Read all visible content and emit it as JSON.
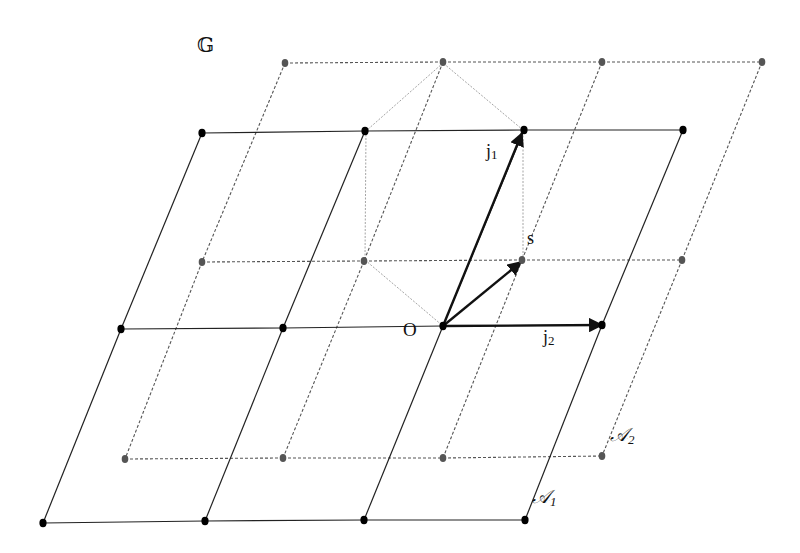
{
  "diagram": {
    "type": "two overlapping 2D lattices with hexagonal cell and basis vectors",
    "labels": {
      "group": "𝔾",
      "origin": "O",
      "j1": "j",
      "j1_sub": "1",
      "j2": "j",
      "j2_sub": "2",
      "s": "s",
      "lattice1": "𝒜",
      "lattice1_sub": "1",
      "lattice2": "𝒜",
      "lattice2_sub": "2"
    },
    "lattice_A1": {
      "style": "solid",
      "color": "#222222",
      "rows": [
        [
          [
            202,
            133
          ],
          [
            365,
            131
          ],
          [
            524,
            130
          ],
          [
            683,
            130
          ]
        ],
        [
          [
            121,
            329
          ],
          [
            283,
            328
          ],
          [
            443,
            326
          ],
          [
            602,
            325
          ]
        ],
        [
          [
            43,
            523
          ],
          [
            205,
            521
          ],
          [
            364,
            520
          ],
          [
            525,
            520
          ]
        ]
      ]
    },
    "lattice_A2": {
      "style": "dashed",
      "color": "#555555",
      "rows": [
        [
          [
            285,
            63
          ],
          [
            443,
            62
          ],
          [
            602,
            62
          ],
          [
            762,
            62
          ]
        ],
        [
          [
            202,
            262
          ],
          [
            364,
            261
          ],
          [
            522,
            260
          ],
          [
            682,
            260
          ]
        ],
        [
          [
            125,
            459
          ],
          [
            283,
            458
          ],
          [
            443,
            458
          ],
          [
            602,
            456
          ]
        ]
      ]
    },
    "hexagon": [
      [
        443,
        63
      ],
      [
        366,
        131
      ],
      [
        365,
        260
      ],
      [
        443,
        326
      ],
      [
        523,
        260
      ],
      [
        523,
        130
      ]
    ],
    "vectors": {
      "j1": {
        "from": [
          443,
          326
        ],
        "to": [
          522,
          133
        ]
      },
      "j2": {
        "from": [
          443,
          326
        ],
        "to": [
          602,
          325
        ]
      },
      "s": {
        "from": [
          443,
          326
        ],
        "to": [
          521,
          262
        ]
      }
    }
  }
}
